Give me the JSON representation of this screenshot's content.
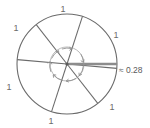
{
  "figure": {
    "type": "geometry-diagram",
    "background_color": "#ffffff",
    "stroke_color": "#6b6b6b",
    "accent_color": "#8c8c8c"
  },
  "circle": {
    "center_x": 67,
    "center_y": 64,
    "radius": 50,
    "stroke_color": "#6b6b6b"
  },
  "spokes": [
    {
      "name": "spoke-1",
      "angle_deg": 72
    },
    {
      "name": "spoke-2",
      "angle_deg": 128
    },
    {
      "name": "spoke-3",
      "angle_deg": 185
    },
    {
      "name": "spoke-4",
      "angle_deg": 252
    },
    {
      "name": "spoke-5",
      "angle_deg": 308
    },
    {
      "name": "spoke-6",
      "angle_deg": 5
    }
  ],
  "sector_labels": [
    {
      "id": "label-top",
      "text": "1",
      "x": 63,
      "y": 12
    },
    {
      "id": "label-upper-left",
      "text": "1",
      "x": 16,
      "y": 31
    },
    {
      "id": "label-lower-left",
      "text": "1",
      "x": 9,
      "y": 90
    },
    {
      "id": "label-bottom",
      "text": "1",
      "x": 51,
      "y": 124
    },
    {
      "id": "label-lower-right",
      "text": "1",
      "x": 112,
      "y": 110
    },
    {
      "id": "label-upper-right",
      "text": "1",
      "x": 116,
      "y": 38
    }
  ],
  "measurement": {
    "label": "≈ 0.28",
    "segment_color": "#8c8c8c",
    "x": 119,
    "y": 73
  },
  "inner_arc_arrows": {
    "name": "angle-arrows",
    "radius": 17,
    "count": 6,
    "color": "#8f8f8f"
  }
}
